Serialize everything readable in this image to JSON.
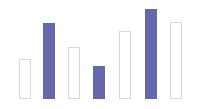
{
  "canvas": {
    "width": 204,
    "height": 109,
    "background_color": "#ffffff"
  },
  "style": {
    "filled_color": "#6568ad",
    "outline_color": "#d8d8d8",
    "outline_fill": "#ffffff",
    "bar_width": 12,
    "baseline_y": 99
  },
  "chart_data": {
    "type": "bar",
    "title": "",
    "subtitle": "",
    "xlabel": "",
    "ylabel": "",
    "grid": false,
    "legend": null,
    "axis_visible": false,
    "tick_labels": [],
    "categories": [
      "1",
      "2",
      "3",
      "4",
      "5",
      "6",
      "7"
    ],
    "values": [
      40,
      76,
      52,
      33,
      68,
      90,
      77
    ],
    "ylim": [
      0,
      99
    ],
    "series": [
      {
        "name": "bars",
        "values": [
          40,
          76,
          52,
          33,
          68,
          90,
          77
        ]
      }
    ],
    "bars": [
      {
        "index": 0,
        "value": 40,
        "style": "outlined",
        "x": 19,
        "top": 59,
        "height": 40,
        "width": 12
      },
      {
        "index": 1,
        "value": 76,
        "style": "filled",
        "x": 43,
        "top": 23,
        "height": 76,
        "width": 12
      },
      {
        "index": 2,
        "value": 52,
        "style": "outlined",
        "x": 68,
        "top": 47,
        "height": 52,
        "width": 12
      },
      {
        "index": 3,
        "value": 33,
        "style": "filled",
        "x": 93,
        "top": 66,
        "height": 33,
        "width": 12
      },
      {
        "index": 4,
        "value": 68,
        "style": "outlined",
        "x": 119,
        "top": 31,
        "height": 68,
        "width": 12
      },
      {
        "index": 5,
        "value": 90,
        "style": "filled",
        "x": 145,
        "top": 9,
        "height": 90,
        "width": 12
      },
      {
        "index": 6,
        "value": 77,
        "style": "outlined",
        "x": 170,
        "top": 22,
        "height": 77,
        "width": 12
      }
    ]
  }
}
